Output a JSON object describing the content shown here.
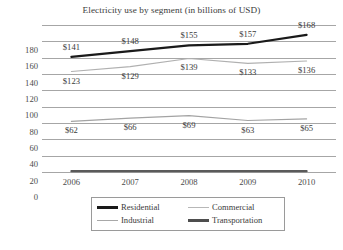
{
  "chart_data": {
    "type": "line",
    "title": "Electricity use by segment (in billions of USD)",
    "xlabel": "",
    "ylabel": "",
    "categories": [
      "2006",
      "2007",
      "2008",
      "2009",
      "2010"
    ],
    "ylim": [
      0,
      180
    ],
    "yticks": [
      "0",
      "20",
      "40",
      "60",
      "80",
      "100",
      "120",
      "140",
      "160",
      "180"
    ],
    "grid": true,
    "legend_position": "bottom",
    "series": [
      {
        "name": "Residential",
        "values": [
          141,
          148,
          155,
          157,
          168
        ],
        "labels": [
          "$141",
          "$148",
          "$155",
          "$157",
          "$168"
        ],
        "color": "#1a1a1a",
        "width": 2.2
      },
      {
        "name": "Commercial",
        "values": [
          123,
          129,
          139,
          133,
          136
        ],
        "labels": [
          "$123",
          "$129",
          "$139",
          "$133",
          "$136"
        ],
        "color": "#b0b0b0",
        "width": 1.1
      },
      {
        "name": "Industrial",
        "values": [
          62,
          66,
          69,
          63,
          65
        ],
        "labels": [
          "$62",
          "$66",
          "$69",
          "$63",
          "$65"
        ],
        "color": "#a3a3a3",
        "width": 1.1
      },
      {
        "name": "Transportation",
        "values": [
          1,
          1,
          1,
          1,
          1
        ],
        "labels": [
          "",
          "",
          "",
          "",
          ""
        ],
        "color": "#5a5a5a",
        "width": 2.2
      }
    ]
  },
  "legend": {
    "items": [
      {
        "label": "Residential",
        "color": "#1a1a1a",
        "thickness": "2.4px"
      },
      {
        "label": "Commercial",
        "color": "#b7b7b7",
        "thickness": "1.2px"
      },
      {
        "label": "Industrial",
        "color": "#a8a8a8",
        "thickness": "1.2px"
      },
      {
        "label": "Transportation",
        "color": "#4e4e4e",
        "thickness": "2.2px"
      }
    ]
  },
  "footer": {
    "bleed": ""
  }
}
